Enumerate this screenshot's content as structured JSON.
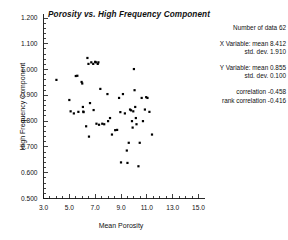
{
  "chart_data": {
    "type": "scatter",
    "title": "Porosity vs. High Frequency Component",
    "xlabel": "Mean Porosity",
    "ylabel": "High Frequency Component",
    "xlim": [
      3.0,
      15.0
    ],
    "ylim": [
      0.5,
      1.2
    ],
    "xticks": [
      "3.0",
      "5.0",
      "7.0",
      "9.0",
      "11.0",
      "13.0",
      "15.0"
    ],
    "xtick_values": [
      3.0,
      5.0,
      7.0,
      9.0,
      11.0,
      13.0,
      15.0
    ],
    "yticks": [
      "0.500",
      "0.600",
      "0.700",
      "0.800",
      "0.900",
      "1.000",
      "1.100",
      "1.200"
    ],
    "ytick_values": [
      0.5,
      0.6,
      0.7,
      0.8,
      0.9,
      1.0,
      1.1,
      1.2
    ],
    "grid": false,
    "legend": "none",
    "marker": "filled-square",
    "marker_color": "#000000",
    "points": [
      [
        4.0,
        0.96
      ],
      [
        5.0,
        0.882
      ],
      [
        5.1,
        0.838
      ],
      [
        5.35,
        0.83
      ],
      [
        5.5,
        0.975
      ],
      [
        5.62,
        0.976
      ],
      [
        5.7,
        0.836
      ],
      [
        5.95,
        0.952
      ],
      [
        6.0,
        0.946
      ],
      [
        6.05,
        0.855
      ],
      [
        6.08,
        0.837
      ],
      [
        6.1,
        0.835
      ],
      [
        6.3,
        0.78
      ],
      [
        6.4,
        1.045
      ],
      [
        6.48,
        1.022
      ],
      [
        6.52,
        0.74
      ],
      [
        6.6,
        0.87
      ],
      [
        6.7,
        1.028
      ],
      [
        6.85,
        1.022
      ],
      [
        6.88,
        0.843
      ],
      [
        7.0,
        1.03
      ],
      [
        7.05,
        1.028
      ],
      [
        7.1,
        0.79
      ],
      [
        7.2,
        1.022
      ],
      [
        7.25,
        1.028
      ],
      [
        7.3,
        0.786
      ],
      [
        7.4,
        0.925
      ],
      [
        7.55,
        0.79
      ],
      [
        7.7,
        0.788
      ],
      [
        7.95,
        0.905
      ],
      [
        8.0,
        0.8
      ],
      [
        8.15,
        0.812
      ],
      [
        8.3,
        0.748
      ],
      [
        8.55,
        0.765
      ],
      [
        8.7,
        0.766
      ],
      [
        8.85,
        0.89
      ],
      [
        8.95,
        0.835
      ],
      [
        9.0,
        0.64
      ],
      [
        9.15,
        0.905
      ],
      [
        9.3,
        0.83
      ],
      [
        9.45,
        0.686
      ],
      [
        9.5,
        0.638
      ],
      [
        9.6,
        0.716
      ],
      [
        9.7,
        0.845
      ],
      [
        9.78,
        0.842
      ],
      [
        9.85,
        0.8
      ],
      [
        9.9,
        0.775
      ],
      [
        9.95,
        0.838
      ],
      [
        10.0,
        1.002
      ],
      [
        10.05,
        0.92
      ],
      [
        10.1,
        0.855
      ],
      [
        10.15,
        0.812
      ],
      [
        10.2,
        0.788
      ],
      [
        10.35,
        0.625
      ],
      [
        10.45,
        0.716
      ],
      [
        10.6,
        0.89
      ],
      [
        10.7,
        0.8
      ],
      [
        10.85,
        0.845
      ],
      [
        10.95,
        0.893
      ],
      [
        11.05,
        0.89
      ],
      [
        11.2,
        0.836
      ],
      [
        11.4,
        0.748
      ]
    ]
  },
  "stats": {
    "count_label": "Number of data",
    "count_value": "62",
    "x_variable_label": "X Variable: mean",
    "x_mean": "8.412",
    "x_std_label": "std. dev.",
    "x_std": "1.910",
    "y_variable_label": "Y Variable: mean",
    "y_mean": "0.855",
    "y_std_label": "std. dev.",
    "y_std": "0.100",
    "correlation_label": "correlation",
    "correlation": "-0.458",
    "rank_correlation_label": "rank correlation",
    "rank_correlation": "-0.416",
    "line_count": "Number of data 62",
    "line_xmean": "X Variable: mean 8.412",
    "line_xstd": "std. dev. 1.910",
    "line_ymean": "Y Variable: mean 0.855",
    "line_ystd": "std. dev. 0.100",
    "line_corr": "correlation -0.458",
    "line_rankcorr": "rank correlation -0.416"
  },
  "colors": {
    "axis": "#111111",
    "marker": "#000000",
    "background": "#ffffff"
  }
}
